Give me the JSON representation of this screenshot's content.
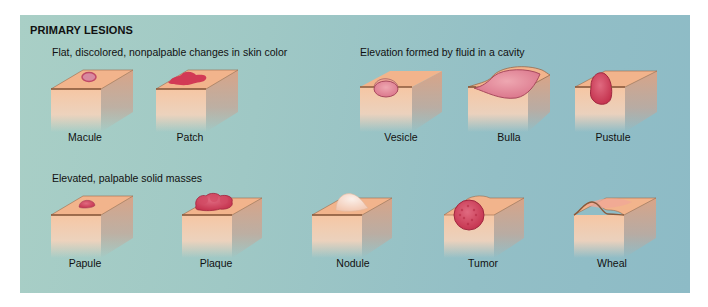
{
  "title": "PRIMARY LESIONS",
  "groups": [
    {
      "label": "Flat, discolored, nonpalpable changes in skin color",
      "items": [
        {
          "name": "Macule"
        },
        {
          "name": "Patch"
        }
      ]
    },
    {
      "label": "Elevation formed by fluid in a cavity",
      "items": [
        {
          "name": "Vesicle"
        },
        {
          "name": "Bulla"
        },
        {
          "name": "Pustule"
        }
      ]
    },
    {
      "label": "Elevated, palpable solid masses",
      "items": [
        {
          "name": "Papule"
        },
        {
          "name": "Plaque"
        },
        {
          "name": "Nodule"
        },
        {
          "name": "Tumor"
        },
        {
          "name": "Wheal"
        }
      ]
    }
  ],
  "colors": {
    "background_left": "#a9cfc6",
    "background_right": "#8dbbc6",
    "skin_top": "#f2b48c",
    "skin_side": "#f5c9a8",
    "lesion": "#c8354f"
  }
}
